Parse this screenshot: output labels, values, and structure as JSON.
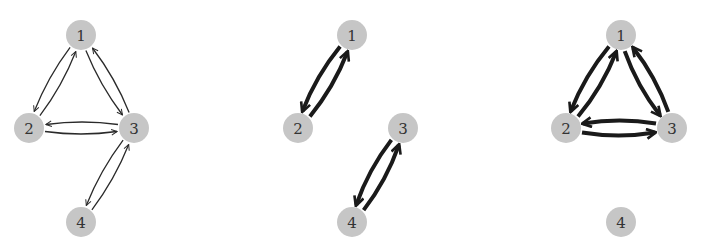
{
  "figure": {
    "panels": [
      {
        "id": "graph-full",
        "style": "thin",
        "nodes": [
          {
            "id": "1",
            "label": "1",
            "x": 81,
            "y": 35
          },
          {
            "id": "2",
            "label": "2",
            "x": 29,
            "y": 128
          },
          {
            "id": "3",
            "label": "3",
            "x": 134,
            "y": 128
          },
          {
            "id": "4",
            "label": "4",
            "x": 81,
            "y": 222
          }
        ],
        "edges": [
          [
            "1",
            "2"
          ],
          [
            "2",
            "1"
          ],
          [
            "1",
            "3"
          ],
          [
            "3",
            "1"
          ],
          [
            "2",
            "3"
          ],
          [
            "3",
            "2"
          ],
          [
            "3",
            "4"
          ],
          [
            "4",
            "3"
          ]
        ]
      },
      {
        "id": "graph-pairs",
        "style": "thick",
        "nodes": [
          {
            "id": "1",
            "label": "1",
            "x": 352,
            "y": 35
          },
          {
            "id": "2",
            "label": "2",
            "x": 298,
            "y": 128
          },
          {
            "id": "3",
            "label": "3",
            "x": 403,
            "y": 128
          },
          {
            "id": "4",
            "label": "4",
            "x": 352,
            "y": 222
          }
        ],
        "edges": [
          [
            "1",
            "2"
          ],
          [
            "2",
            "1"
          ],
          [
            "3",
            "4"
          ],
          [
            "4",
            "3"
          ]
        ]
      },
      {
        "id": "graph-triangle",
        "style": "thick",
        "nodes": [
          {
            "id": "1",
            "label": "1",
            "x": 621,
            "y": 35
          },
          {
            "id": "2",
            "label": "2",
            "x": 566,
            "y": 128
          },
          {
            "id": "3",
            "label": "3",
            "x": 672,
            "y": 128
          },
          {
            "id": "4",
            "label": "4",
            "x": 621,
            "y": 222
          }
        ],
        "edges": [
          [
            "1",
            "2"
          ],
          [
            "2",
            "1"
          ],
          [
            "1",
            "3"
          ],
          [
            "3",
            "1"
          ],
          [
            "2",
            "3"
          ],
          [
            "3",
            "2"
          ]
        ]
      }
    ],
    "colors": {
      "node_fill": "#c6c6c6",
      "label": "#333333",
      "edge": "#1a1a1a",
      "background": "#ffffff"
    },
    "node_radius": 15
  }
}
